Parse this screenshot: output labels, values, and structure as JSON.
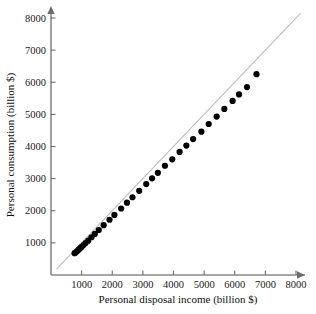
{
  "chart_data": {
    "type": "scatter",
    "title": "",
    "xlabel": "Personal disposal income (billion $)",
    "ylabel": "Personal consumption (billion $)",
    "xlim": [
      0,
      8400
    ],
    "ylim": [
      0,
      8400
    ],
    "xticks": [
      1000,
      2000,
      3000,
      4000,
      5000,
      6000,
      7000,
      8000
    ],
    "xtick_labels": [
      "1000",
      "2000",
      "3000",
      "4000",
      "5000",
      "6000",
      "7000",
      "8000"
    ],
    "yticks": [
      1000,
      2000,
      3000,
      4000,
      5000,
      6000,
      7000,
      8000
    ],
    "ytick_labels": [
      "1000",
      "2000",
      "3000",
      "4000",
      "5000",
      "6000",
      "7000",
      "8000"
    ],
    "grid": false,
    "legend": "none",
    "marker": "filled-circle",
    "marker_color": "#000000",
    "marker_size": 3.1,
    "reference_line": {
      "name": "45-degree reference line",
      "color": "#bdbdbd",
      "from": [
        180,
        180
      ],
      "to": [
        8150,
        8150
      ]
    },
    "series": [
      {
        "name": "Consumption vs income",
        "points": [
          [
            770,
            680
          ],
          [
            800,
            700
          ],
          [
            830,
            720
          ],
          [
            865,
            755
          ],
          [
            905,
            790
          ],
          [
            955,
            835
          ],
          [
            1000,
            880
          ],
          [
            1060,
            930
          ],
          [
            1130,
            995
          ],
          [
            1215,
            1070
          ],
          [
            1320,
            1175
          ],
          [
            1430,
            1280
          ],
          [
            1560,
            1400
          ],
          [
            1720,
            1550
          ],
          [
            1910,
            1720
          ],
          [
            2070,
            1870
          ],
          [
            2290,
            2070
          ],
          [
            2480,
            2250
          ],
          [
            2660,
            2420
          ],
          [
            2880,
            2620
          ],
          [
            3110,
            2830
          ],
          [
            3300,
            3010
          ],
          [
            3490,
            3180
          ],
          [
            3720,
            3400
          ],
          [
            3960,
            3600
          ],
          [
            4200,
            3830
          ],
          [
            4420,
            4030
          ],
          [
            4640,
            4230
          ],
          [
            4910,
            4460
          ],
          [
            5150,
            4700
          ],
          [
            5410,
            4930
          ],
          [
            5660,
            5170
          ],
          [
            5930,
            5420
          ],
          [
            6140,
            5620
          ],
          [
            6400,
            5850
          ],
          [
            6710,
            6250
          ]
        ]
      }
    ],
    "annotations": [
      {
        "name": "outlier-below-line",
        "x": 6710,
        "y": 6250,
        "note": "final point lies visibly below the reference line"
      }
    ]
  },
  "axes": {
    "x_title": "Personal disposal income (billion $)",
    "y_title": "Personal consumption (billion $)"
  },
  "colors": {
    "axis": "#8a8a8a",
    "tick": "#6e6e6e",
    "point": "#000000",
    "reference_line": "#bdbdbd",
    "text": "#111111",
    "background": "#ffffff"
  }
}
